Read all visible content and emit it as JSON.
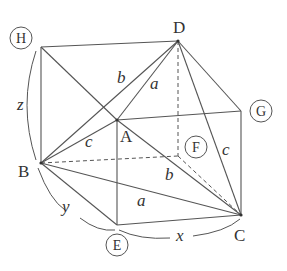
{
  "figure": {
    "type": "geometry-diagram",
    "vertices": {
      "H": {
        "label": "H",
        "circled": true
      },
      "D": {
        "label": "D",
        "circled": false
      },
      "G": {
        "label": "G",
        "circled": true
      },
      "A": {
        "label": "A",
        "circled": false
      },
      "F": {
        "label": "F",
        "circled": true
      },
      "B": {
        "label": "B",
        "circled": false
      },
      "E": {
        "label": "E",
        "circled": true
      },
      "C": {
        "label": "C",
        "circled": false
      }
    },
    "edge_labels": {
      "a_top": "a",
      "a_bottom": "a",
      "b_top": "b",
      "b_bottom": "b",
      "c_left": "c",
      "c_right": "c"
    },
    "dimension_labels": {
      "x": "x",
      "y": "y",
      "z": "z"
    }
  }
}
